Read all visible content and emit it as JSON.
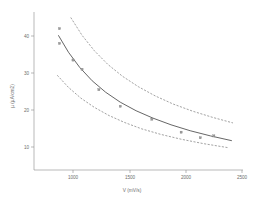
{
  "chart_data": {
    "type": "scatter",
    "title": "",
    "subtitle": "",
    "xlabel": "V (mV/s)",
    "ylabel": "µ (µA/cm2)",
    "xlim": [
      800,
      2550
    ],
    "ylim": [
      6,
      45
    ],
    "xticks": [
      1000,
      1500,
      2000,
      2500
    ],
    "xtick_labels": [
      "1000",
      "1500",
      "2000",
      "2500"
    ],
    "yticks": [
      10,
      20,
      30,
      40
    ],
    "ytick_labels": [
      "10",
      "20",
      "30",
      "40"
    ],
    "grid": false,
    "legend": "none",
    "series": [
      {
        "name": "observations",
        "type": "scatter",
        "marker": "square",
        "x": [
          880,
          880,
          1000,
          1080,
          1230,
          1420,
          1700,
          1960,
          2130,
          2250
        ],
        "y": [
          42.0,
          38.0,
          33.5,
          31.0,
          25.5,
          21.0,
          17.5,
          14.0,
          12.5,
          13.0
        ]
      },
      {
        "name": "fitted curve",
        "type": "line",
        "style": "solid",
        "x": [
          870,
          960,
          1060,
          1170,
          1290,
          1420,
          1560,
          1710,
          1870,
          2040,
          2220,
          2410
        ],
        "y": [
          40.2,
          35.6,
          31.5,
          27.9,
          24.8,
          22.1,
          19.8,
          17.8,
          16.0,
          14.4,
          13.0,
          11.7
        ]
      },
      {
        "name": "upper confidence band",
        "type": "line",
        "style": "dashed",
        "x": [
          980,
          1080,
          1190,
          1310,
          1440,
          1580,
          1730,
          1890,
          2060,
          2240,
          2420
        ],
        "y": [
          45.0,
          40.2,
          36.0,
          32.3,
          29.1,
          26.3,
          23.8,
          21.6,
          19.7,
          18.0,
          16.5
        ]
      },
      {
        "name": "lower confidence band",
        "type": "line",
        "style": "dashed",
        "x": [
          860,
          960,
          1070,
          1190,
          1320,
          1460,
          1610,
          1780,
          1960,
          2160,
          2380
        ],
        "y": [
          29.4,
          26.1,
          23.2,
          20.7,
          18.5,
          16.6,
          14.9,
          13.4,
          12.1,
          10.9,
          9.8
        ]
      }
    ]
  },
  "axes": {
    "x": {
      "title": "V (mV/s)",
      "labels": [
        "1000",
        "1500",
        "2000",
        "2500"
      ]
    },
    "y": {
      "title": "µ (µA/cm2)",
      "labels": [
        "40",
        "30",
        "20",
        "10"
      ]
    }
  },
  "colors": {
    "background": "#ffffff",
    "axis": "#8c8c8c",
    "fit": "#4a4a4a",
    "band": "#6f6f6f",
    "marker": "#9a9a9a",
    "text": "#6d6d6d"
  }
}
